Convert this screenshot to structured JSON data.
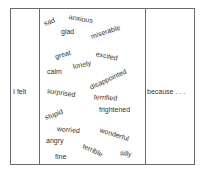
{
  "left_label": "I felt",
  "right_label": "because . . .",
  "words": [
    {
      "text": "sad",
      "x": 44,
      "y": 20,
      "rot": -20
    },
    {
      "text": "anxious",
      "x": 69,
      "y": 13,
      "rot": 10
    },
    {
      "text": "glad",
      "x": 61,
      "y": 28,
      "rot": 0
    },
    {
      "text": "miserable",
      "x": 91,
      "y": 33,
      "rot": -18
    },
    {
      "text": "great",
      "x": 55,
      "y": 53,
      "rot": -15
    },
    {
      "text": "excited",
      "x": 96,
      "y": 50,
      "rot": 12
    },
    {
      "text": "lonely",
      "x": 73,
      "y": 63,
      "rot": -12
    },
    {
      "text": "calm",
      "x": 47,
      "y": 68,
      "rot": 0
    },
    {
      "text": "disappointed",
      "x": 90,
      "y": 84,
      "rot": -25
    },
    {
      "text": "surprised",
      "x": 47,
      "y": 87,
      "rot": 8
    },
    {
      "text": "terrified",
      "x": 94,
      "y": 93,
      "rot": 4
    },
    {
      "text": "stupid",
      "x": 45,
      "y": 114,
      "rot": -20
    },
    {
      "text": "frightened",
      "x": 99,
      "y": 106,
      "rot": 0
    },
    {
      "text": "worried",
      "x": 57,
      "y": 125,
      "rot": 5
    },
    {
      "text": "wonderful",
      "x": 100,
      "y": 126,
      "rot": 18
    },
    {
      "text": "angry",
      "x": 46,
      "y": 137,
      "rot": 0
    },
    {
      "text": "terrible",
      "x": 83,
      "y": 142,
      "rot": 25
    },
    {
      "text": "silly",
      "x": 120,
      "y": 149,
      "rot": 8
    },
    {
      "text": "fine",
      "x": 55,
      "y": 153,
      "rot": 0
    }
  ]
}
